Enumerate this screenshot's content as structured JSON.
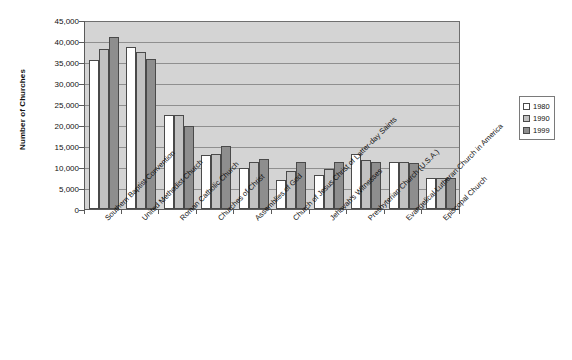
{
  "chart_data": {
    "type": "bar",
    "title": "",
    "xlabel": "",
    "ylabel": "Number of Churches",
    "ylim": [
      0,
      45000
    ],
    "ytick_step": 5000,
    "yticks": [
      "0",
      "5,000",
      "10,000",
      "15,000",
      "20,000",
      "25,000",
      "30,000",
      "35,000",
      "40,000",
      "45,000"
    ],
    "grid": true,
    "legend_position": "right",
    "categories": [
      "Southern Baptist Convention",
      "United Methodist Church",
      "Roman Catholic Church",
      "Churches of Christ",
      "Assemblies of God",
      "Church of Jesus Christ of Latter-day Saints",
      "Jehovah's Witnesses",
      "Presbyterian Church (U.S.A.)",
      "Evangelical Lutheran Church in America",
      "Episcopal Church"
    ],
    "series": [
      {
        "name": "1980",
        "color": "#ffffff",
        "values": [
          35500,
          38500,
          22300,
          12800,
          9700,
          6900,
          8100,
          13100,
          11100,
          7400
        ]
      },
      {
        "name": "1990",
        "color": "#c2c2c2",
        "values": [
          38000,
          37400,
          22500,
          13100,
          11100,
          9000,
          9500,
          11600,
          11100,
          7400
        ]
      },
      {
        "name": "1999",
        "color": "#8e8e8e",
        "values": [
          41000,
          35600,
          19700,
          15000,
          12000,
          11100,
          11300,
          11200,
          10900,
          7400
        ]
      }
    ]
  },
  "legend": {
    "items": [
      {
        "label": "1980"
      },
      {
        "label": "1990"
      },
      {
        "label": "1999"
      }
    ]
  }
}
